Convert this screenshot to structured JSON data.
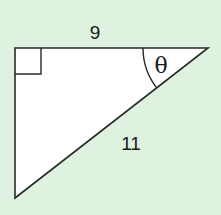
{
  "diagram": {
    "type": "right-triangle",
    "background_color": "#dff1df",
    "fill_color": "#ffffff",
    "stroke_color": "#2a2a2a",
    "vertices": {
      "right_angle": [
        15,
        48
      ],
      "theta_vertex": [
        208,
        48
      ],
      "bottom": [
        15,
        198
      ]
    },
    "labels": {
      "top_side": "9",
      "hypotenuse": "11",
      "angle": "θ"
    },
    "right_angle_marker": true,
    "angle_arc_radius": 65
  }
}
